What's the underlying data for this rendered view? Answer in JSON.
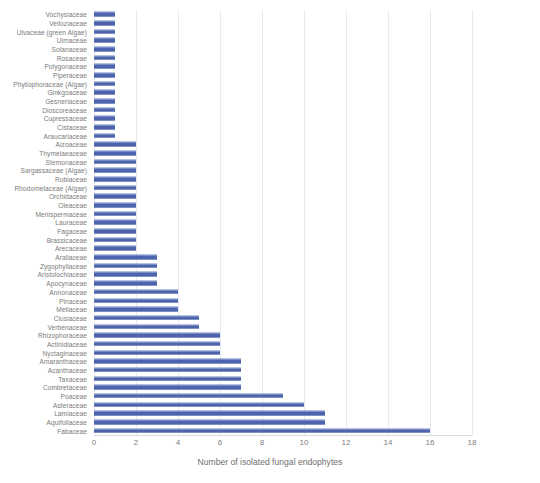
{
  "chart_data": {
    "type": "bar",
    "orientation": "horizontal",
    "title": "",
    "xlabel": "Number of isolated fungal endophytes",
    "ylabel": "",
    "xlim": [
      0,
      18
    ],
    "xticks": [
      0,
      2,
      4,
      6,
      8,
      10,
      12,
      14,
      16,
      18
    ],
    "grid": "vertical",
    "legend": "none",
    "bar_color": "#4d63ab",
    "categories": [
      "Vochysiaceae",
      "Velloziaceae",
      "Ulvaceae (green Algae)",
      "Ulmaceae",
      "Solanaceae",
      "Rosaceae",
      "Polygonaceae",
      "Piperaceae",
      "Phyllophoraceae (Algae)",
      "Ginkgoaceae",
      "Gesneriaceae",
      "Dioscoreaceae",
      "Cupressaceae",
      "Cistaceae",
      "Araucariaceae",
      "Aizoaceae",
      "Thymelaeaceae",
      "Stemonaceae",
      "Sargassaceae (Algae)",
      "Rubiaceae",
      "Rhodomelaceae (Algae)",
      "Orchidaceae",
      "Oleaceae",
      "Menispermaceae",
      "Lauraceae",
      "Fagaceae",
      "Brassicaceae",
      "Arecaceae",
      "Araliaceae",
      "Zygophyllaceae",
      "Aristolochiaceae",
      "Apocynaceae",
      "Annonaceae",
      "Pinaceae",
      "Meliaceae",
      "Clusiaceae",
      "Verbenaceae",
      "Rhizophoraceae",
      "Actinidiaceae",
      "Nyctaginaceae",
      "Amaranthaceae",
      "Acanthaceae",
      "Taxaceae",
      "Combretaceae",
      "Poaceae",
      "Asteraceae",
      "Lamiaceae",
      "Aquifoliaceae",
      "Fabaceae"
    ],
    "values": [
      1,
      1,
      1,
      1,
      1,
      1,
      1,
      1,
      1,
      1,
      1,
      1,
      1,
      1,
      1,
      2,
      2,
      2,
      2,
      2,
      2,
      2,
      2,
      2,
      2,
      2,
      2,
      2,
      3,
      3,
      3,
      3,
      4,
      4,
      4,
      5,
      5,
      6,
      6,
      6,
      7,
      7,
      7,
      7,
      9,
      10,
      11,
      11,
      16
    ]
  }
}
